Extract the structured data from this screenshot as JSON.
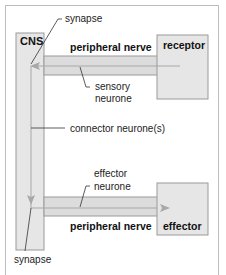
{
  "diagram": {
    "title": "",
    "nodes": {
      "cns": {
        "label": "CNS"
      },
      "receptor": {
        "label": "receptor"
      },
      "effector": {
        "label": "effector"
      }
    },
    "pathways": {
      "top_nerve": {
        "label": "peripheral nerve"
      },
      "bottom_nerve": {
        "label": "peripheral nerve"
      }
    },
    "annotations": {
      "synapse_top": "synapse",
      "sensory_neurone_line1": "sensory",
      "sensory_neurone_line2": "neurone",
      "connector_neurone": "connector neurone(s)",
      "effector_neurone_line1": "effector",
      "effector_neurone_line2": "neurone",
      "synapse_bottom": "synapse"
    },
    "colors": {
      "box_fill": "#e6e6e6",
      "box_stroke": "#9a9a9a",
      "bar_fill": "#dcdcdc",
      "arrow": "#a8a8a8",
      "leader_line": "#333333",
      "frame": "#bdbdbd"
    }
  }
}
